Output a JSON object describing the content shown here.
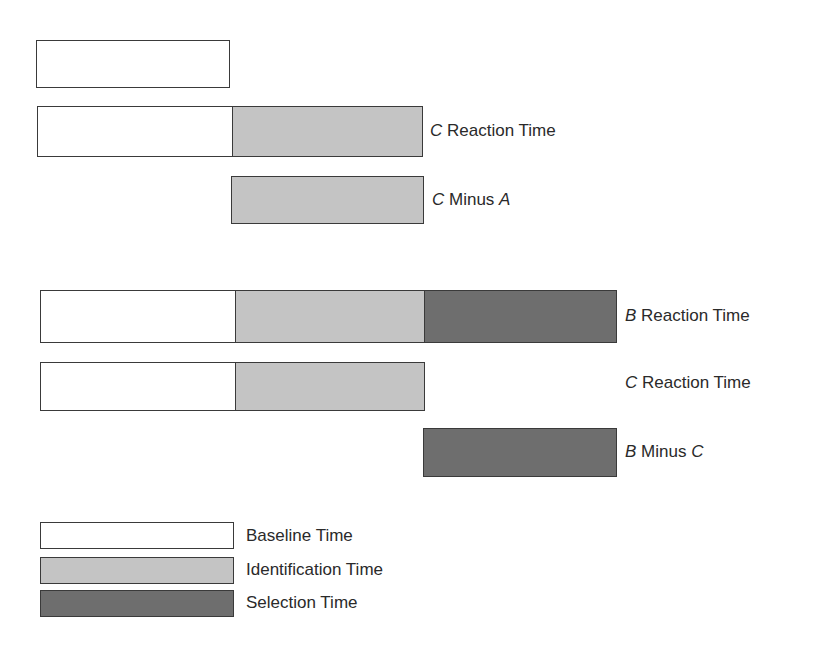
{
  "colors": {
    "baseline": "#ffffff",
    "identification": "#c4c4c4",
    "selection": "#6e6e6e",
    "outline": "#3a3a3a"
  },
  "rows": [
    {
      "id": "a-reaction",
      "segments": [
        "baseline"
      ],
      "label_var": "",
      "label_text": "",
      "label_var2": ""
    },
    {
      "id": "c-reaction-top",
      "segments": [
        "baseline",
        "identification"
      ],
      "label_var": "C",
      "label_text": " Reaction Time",
      "label_var2": ""
    },
    {
      "id": "c-minus-a",
      "segments": [
        "identification"
      ],
      "label_var": "C",
      "label_text": " Minus ",
      "label_var2": "A"
    },
    {
      "id": "b-reaction",
      "segments": [
        "baseline",
        "identification",
        "selection"
      ],
      "label_var": "B",
      "label_text": " Reaction Time",
      "label_var2": ""
    },
    {
      "id": "c-reaction-bottom",
      "segments": [
        "baseline",
        "identification"
      ],
      "label_var": "C",
      "label_text": " Reaction Time",
      "label_var2": ""
    },
    {
      "id": "b-minus-c",
      "segments": [
        "selection"
      ],
      "label_var": "B",
      "label_text": " Minus ",
      "label_var2": "C"
    }
  ],
  "legend": [
    {
      "key": "baseline",
      "label": "Baseline Time"
    },
    {
      "key": "identification",
      "label": "Identification Time"
    },
    {
      "key": "selection",
      "label": "Selection Time"
    }
  ]
}
